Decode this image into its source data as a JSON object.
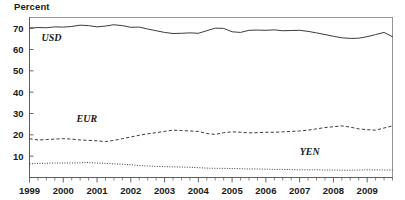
{
  "chart": {
    "axis_title": "Percent",
    "top_partial_text": ""
  },
  "chart_data": {
    "type": "line",
    "title": "",
    "subtitle": "",
    "xlabel": "",
    "ylabel": "Percent",
    "ylim": [
      0,
      75
    ],
    "xlim": [
      1999.0,
      2009.75
    ],
    "grid": false,
    "legend_position": "inline-annotation",
    "y_ticks": [
      10,
      20,
      30,
      40,
      50,
      60,
      70
    ],
    "x_ticks": [
      "1999",
      "2000",
      "2001",
      "2002",
      "2003",
      "2004",
      "2005",
      "2006",
      "2007",
      "2008",
      "2009"
    ],
    "x_minor_tick_interval": "quarterly",
    "x": [
      1999.0,
      1999.25,
      1999.5,
      1999.75,
      2000.0,
      2000.25,
      2000.5,
      2000.75,
      2001.0,
      2001.25,
      2001.5,
      2001.75,
      2002.0,
      2002.25,
      2002.5,
      2002.75,
      2003.0,
      2003.25,
      2003.5,
      2003.75,
      2004.0,
      2004.25,
      2004.5,
      2004.75,
      2005.0,
      2005.25,
      2005.5,
      2005.75,
      2006.0,
      2006.25,
      2006.5,
      2006.75,
      2007.0,
      2007.25,
      2007.5,
      2007.75,
      2008.0,
      2008.25,
      2008.5,
      2008.75,
      2009.0,
      2009.25,
      2009.5,
      2009.75
    ],
    "series": [
      {
        "name": "USD",
        "label": "USD",
        "style": "solid",
        "values": [
          70.0,
          70.3,
          70.2,
          70.6,
          70.5,
          70.8,
          71.4,
          71.2,
          70.6,
          71.0,
          71.6,
          71.2,
          70.4,
          70.5,
          69.6,
          68.8,
          68.0,
          67.5,
          67.6,
          67.8,
          67.6,
          68.8,
          70.0,
          69.9,
          68.3,
          68.0,
          69.0,
          69.1,
          69.0,
          69.2,
          68.8,
          68.9,
          69.0,
          68.5,
          67.8,
          67.0,
          66.2,
          65.5,
          65.2,
          65.3,
          66.0,
          67.0,
          68.0,
          66.0
        ]
      },
      {
        "name": "EUR",
        "label": "EUR",
        "style": "dashed",
        "values": [
          18.2,
          17.6,
          17.8,
          18.0,
          18.2,
          18.0,
          17.6,
          17.4,
          17.2,
          16.8,
          17.4,
          18.2,
          19.0,
          19.8,
          20.5,
          21.0,
          21.6,
          22.2,
          22.0,
          21.8,
          21.6,
          20.6,
          20.2,
          21.0,
          21.4,
          21.2,
          20.9,
          21.0,
          21.2,
          21.2,
          21.4,
          21.6,
          21.8,
          22.2,
          22.8,
          23.4,
          23.8,
          24.2,
          23.6,
          22.8,
          22.4,
          22.2,
          23.2,
          24.2
        ]
      },
      {
        "name": "YEN",
        "label": "YEN",
        "style": "dotted",
        "values": [
          6.4,
          6.6,
          6.7,
          6.8,
          6.8,
          6.8,
          6.9,
          7.0,
          6.8,
          6.6,
          6.4,
          6.2,
          6.0,
          5.6,
          5.4,
          5.2,
          5.1,
          5.0,
          4.9,
          4.8,
          4.6,
          4.4,
          4.3,
          4.3,
          4.2,
          4.1,
          4.0,
          4.0,
          3.9,
          3.8,
          3.8,
          3.7,
          3.6,
          3.6,
          3.6,
          3.5,
          3.5,
          3.4,
          3.4,
          3.5,
          3.6,
          3.6,
          3.5,
          3.5
        ]
      }
    ],
    "annotations": [
      {
        "text": "USD",
        "x": 1999.65,
        "y": 64.0
      },
      {
        "text": "EUR",
        "x": 2000.7,
        "y": 26.0
      },
      {
        "text": "YEN",
        "x": 2007.3,
        "y": 10.5
      }
    ]
  }
}
